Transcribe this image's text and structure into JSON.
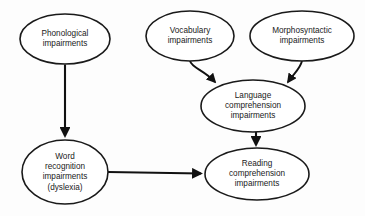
{
  "diagram": {
    "type": "flow-diagram",
    "background_color": "#fdfdfd",
    "line_color": "#111111",
    "node_fill_color": "#ffffff",
    "nodes": [
      {
        "id": "phonological",
        "shape": "ellipse",
        "lines": [
          "Phonological",
          "impairments"
        ],
        "text": "Phonological impairments",
        "cx": 65,
        "cy": 39,
        "rx": 45,
        "ry": 25
      },
      {
        "id": "vocabulary",
        "shape": "ellipse",
        "lines": [
          "Vocabulary",
          "impairments"
        ],
        "text": "Vocabulary impairments",
        "cx": 190,
        "cy": 36,
        "rx": 44,
        "ry": 25
      },
      {
        "id": "morphosyntactic",
        "shape": "ellipse",
        "lines": [
          "Morphosyntactic",
          "impairments"
        ],
        "text": "Morphosyntactic impairments",
        "cx": 302,
        "cy": 36,
        "rx": 52,
        "ry": 25
      },
      {
        "id": "language-comprehension",
        "shape": "ellipse",
        "lines": [
          "Language",
          "comprehension",
          "impairments"
        ],
        "text": "Language comprehension impairments",
        "cx": 253,
        "cy": 106,
        "rx": 52,
        "ry": 26
      },
      {
        "id": "word-recognition",
        "shape": "ellipse",
        "lines": [
          "Word",
          "recognition",
          "impairments",
          "(dyslexia)"
        ],
        "text": "Word recognition impairments (dyslexia)",
        "cx": 65,
        "cy": 172,
        "rx": 43,
        "ry": 32
      },
      {
        "id": "reading-comprehension",
        "shape": "ellipse",
        "lines": [
          "Reading",
          "comprehension",
          "impairments"
        ],
        "text": "Reading comprehension impairments",
        "cx": 257,
        "cy": 174,
        "rx": 52,
        "ry": 26
      }
    ],
    "edges": [
      {
        "id": "phonological-to-word-recognition",
        "from": "phonological",
        "to": "word-recognition",
        "style": "straight-vertical",
        "arrowhead": "filled-triangle"
      },
      {
        "id": "vocabulary-to-language-comprehension",
        "from": "vocabulary",
        "to": "language-comprehension",
        "style": "curved",
        "arrowhead": "filled-triangle"
      },
      {
        "id": "morphosyntactic-to-language-comprehension",
        "from": "morphosyntactic",
        "to": "language-comprehension",
        "style": "curved",
        "arrowhead": "filled-triangle"
      },
      {
        "id": "language-comprehension-to-reading-comprehension",
        "from": "language-comprehension",
        "to": "reading-comprehension",
        "style": "straight-vertical",
        "arrowhead": "filled-triangle"
      },
      {
        "id": "word-recognition-to-reading-comprehension",
        "from": "word-recognition",
        "to": "reading-comprehension",
        "style": "straight-horizontal",
        "arrowhead": "filled-triangle"
      }
    ]
  }
}
